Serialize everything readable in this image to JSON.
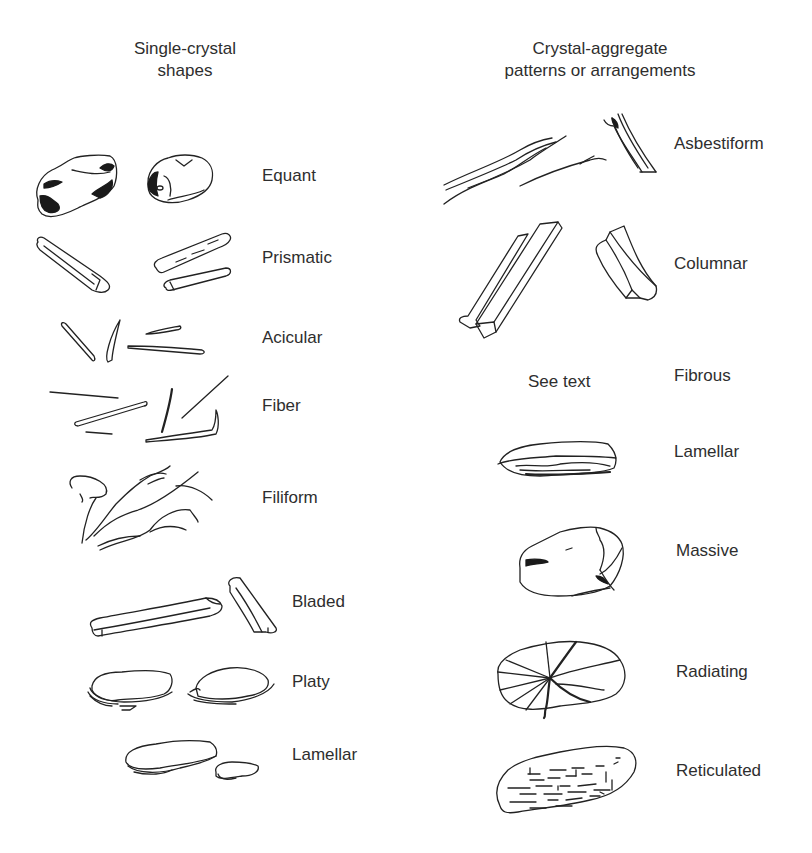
{
  "figure": {
    "columns": [
      {
        "id": "single-crystal",
        "heading_line1": "Single-crystal",
        "heading_line2": "shapes",
        "items": [
          {
            "label": "Equant"
          },
          {
            "label": "Prismatic"
          },
          {
            "label": "Acicular"
          },
          {
            "label": "Fiber"
          },
          {
            "label": "Filiform"
          },
          {
            "label": "Bladed"
          },
          {
            "label": "Platy"
          },
          {
            "label": "Lamellar"
          }
        ]
      },
      {
        "id": "crystal-aggregate",
        "heading_line1": "Crystal-aggregate",
        "heading_line2": "patterns or arrangements",
        "items": [
          {
            "label": "Asbestiform"
          },
          {
            "label": "Columnar"
          },
          {
            "label": "Fibrous",
            "note": "See text"
          },
          {
            "label": "Lamellar"
          },
          {
            "label": "Massive"
          },
          {
            "label": "Radiating"
          },
          {
            "label": "Reticulated"
          }
        ]
      }
    ]
  }
}
